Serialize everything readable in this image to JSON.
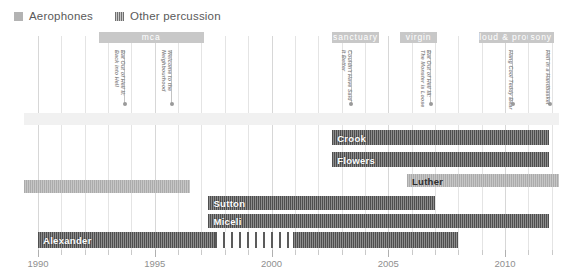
{
  "legend": {
    "items": [
      {
        "label": "Aerophones",
        "swatch": "aero",
        "color": "#b3b3b3"
      },
      {
        "label": "Other percussion",
        "swatch": "perc",
        "color": "#6f6f6f"
      }
    ]
  },
  "axis": {
    "year_min": 1989.4,
    "year_max": 2012.3,
    "px_per_year": 23.35,
    "origin_px": 38,
    "tick_labels": [
      "1990",
      "1995",
      "2000",
      "2005",
      "2010"
    ],
    "tick_years": [
      1990,
      1995,
      2000,
      2005,
      2010
    ],
    "minor_step": 1
  },
  "record_labels": [
    {
      "name": "mca",
      "start": 1992.6,
      "end": 1997.1
    },
    {
      "name": "sanctuary",
      "start": 2002.6,
      "end": 2004.6
    },
    {
      "name": "virgin",
      "start": 2005.5,
      "end": 2007.1
    },
    {
      "name": "loud & proud",
      "start": 2008.9,
      "end": 2011.0
    },
    {
      "name": "sony",
      "start": 2011.0,
      "end": 2012.1
    }
  ],
  "albums": [
    {
      "title_l1": "Bat Out of Hell II:",
      "title_l2": "Back into Hell",
      "year": 1993.7
    },
    {
      "title_l1": "Welcome to the",
      "title_l2": "Neighbourhood",
      "year": 1995.7
    },
    {
      "title_l1": "Couldn't Have Said",
      "title_l2": "It Better",
      "year": 2003.4
    },
    {
      "title_l1": "Bat Out of Hell III:",
      "title_l2": "The Monster is Loose",
      "year": 2006.8
    },
    {
      "title_l1": "Hang Cool Teddy Bear",
      "title_l2": "",
      "year": 2010.3
    },
    {
      "title_l1": "Hell in a Handbasket",
      "title_l2": "",
      "year": 2011.9
    }
  ],
  "chart_data": {
    "type": "bar",
    "title": "",
    "xlabel": "",
    "ylabel": "",
    "xlim": [
      1989.4,
      2012.3
    ],
    "grid": true,
    "legend_position": "top-left",
    "categories": [
      "(top band)",
      "Crook",
      "Flowers",
      "Luther",
      "(aerophones band)",
      "Sutton",
      "Miceli",
      "Alexander"
    ],
    "bars": [
      {
        "name": "(top band)",
        "kind": "band",
        "series": "background",
        "segments": [
          {
            "start": 1989.4,
            "end": 2012.3,
            "style": "faint"
          }
        ],
        "label": "",
        "y": 113,
        "height": 12
      },
      {
        "name": "Crook",
        "kind": "bar",
        "series": "Other percussion",
        "segments": [
          {
            "start": 2002.6,
            "end": 2011.9,
            "style": "perc"
          }
        ],
        "label": "Crook",
        "y": 130,
        "height": 15
      },
      {
        "name": "Flowers",
        "kind": "bar",
        "series": "Other percussion",
        "segments": [
          {
            "start": 2002.6,
            "end": 2011.9,
            "style": "perc"
          }
        ],
        "label": "Flowers",
        "y": 152,
        "height": 15
      },
      {
        "name": "Luther",
        "kind": "bar",
        "series": "Aerophones",
        "segments": [
          {
            "start": 2005.8,
            "end": 2012.3,
            "style": "aero"
          }
        ],
        "label": "Luther",
        "y": 174,
        "height": 13
      },
      {
        "name": "(aerophones band)",
        "kind": "band",
        "series": "Aerophones",
        "segments": [
          {
            "start": 1989.4,
            "end": 1996.5,
            "style": "aero"
          }
        ],
        "label": "",
        "y": 180,
        "height": 13
      },
      {
        "name": "Sutton",
        "kind": "bar",
        "series": "Other percussion",
        "segments": [
          {
            "start": 1997.3,
            "end": 2007.0,
            "style": "perc"
          }
        ],
        "label": "Sutton",
        "y": 196,
        "height": 14
      },
      {
        "name": "Miceli",
        "kind": "bar",
        "series": "Other percussion",
        "segments": [
          {
            "start": 1997.3,
            "end": 2011.9,
            "style": "perc"
          }
        ],
        "label": "Miceli",
        "y": 214,
        "height": 14
      },
      {
        "name": "Alexander",
        "kind": "bar",
        "series": "Other percussion",
        "segments": [
          {
            "start": 1990.0,
            "end": 1997.6,
            "style": "perc"
          },
          {
            "start": 1997.6,
            "end": 2000.9,
            "style": "perc-sparse"
          },
          {
            "start": 2000.9,
            "end": 2008.0,
            "style": "perc"
          }
        ],
        "label": "Alexander",
        "y": 232,
        "height": 16
      }
    ]
  }
}
